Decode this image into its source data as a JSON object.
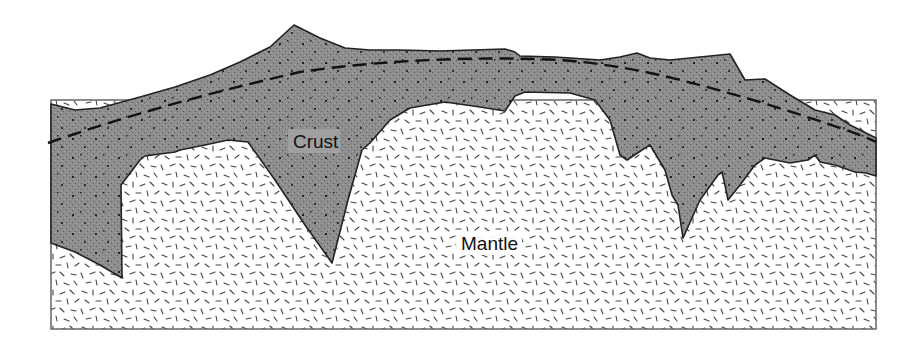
{
  "diagram": {
    "type": "geological-cross-section",
    "layers": [
      {
        "id": "crust",
        "label": "Crust",
        "fill": "#8e8e8e",
        "pattern": "stipple-dots"
      },
      {
        "id": "mantle",
        "label": "Mantle",
        "fill": "#ffffff",
        "pattern": "random-dashes"
      }
    ],
    "boundary_line": {
      "style": "dashed",
      "color": "#111111"
    },
    "labels": {
      "crust": "Crust",
      "mantle": "Mantle"
    }
  }
}
